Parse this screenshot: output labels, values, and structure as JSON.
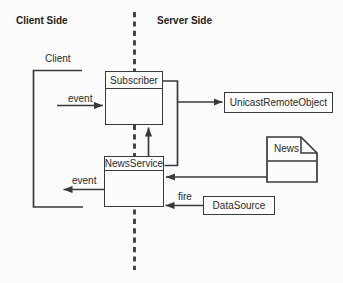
{
  "canvas": {
    "background": "#fbfbfb",
    "line_color": "#3a3a3a",
    "text_color": "#2b2b2b"
  },
  "headers": {
    "client_side": "Client Side",
    "server_side": "Server Side"
  },
  "labels": {
    "client": "Client",
    "event_top": "event",
    "event_bottom": "event",
    "fire": "fire"
  },
  "nodes": {
    "subscriber": {
      "label": "Subscriber"
    },
    "news_service": {
      "label": "NewsService"
    },
    "unicast_remote_object": {
      "label": "UnicastRemoteObject"
    },
    "news": {
      "label": "News"
    },
    "data_source": {
      "label": "DataSource"
    }
  }
}
